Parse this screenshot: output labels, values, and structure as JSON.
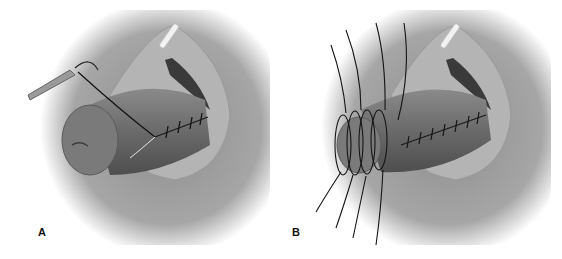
{
  "figure": {
    "panels": [
      {
        "label": "A",
        "description": "Urethral/tubular closure with running suture; needle holder and needle passing suture"
      },
      {
        "label": "B",
        "description": "Completed closure with circumferential stay sutures around the distal end"
      }
    ],
    "colors": {
      "background_shadow": "#8a8a8a",
      "tissue": "#6e6e6e",
      "tissue_light": "#9a9a9a",
      "suture": "#151515",
      "catheter": "#f0f0f0"
    }
  }
}
